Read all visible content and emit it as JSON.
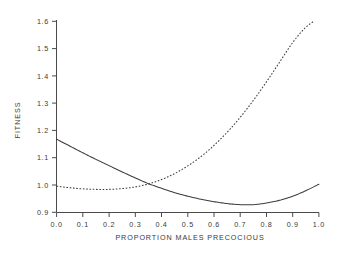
{
  "chart_data": {
    "type": "line",
    "title": "",
    "xlabel": "PROPORTION  MALES  PRECOCIOUS",
    "ylabel": "FITNESS",
    "xlim": [
      0.0,
      1.0
    ],
    "ylim": [
      0.9,
      1.6
    ],
    "grid": false,
    "legend": "none",
    "xticks": [
      "0.0",
      "0.1",
      "0.2",
      "0.3",
      "0.4",
      "0.5",
      "0.6",
      "0.7",
      "0.8",
      "0.9",
      "1.0"
    ],
    "xtick_values": [
      0.0,
      0.1,
      0.2,
      0.3,
      0.4,
      0.5,
      0.6,
      0.7,
      0.8,
      0.9,
      1.0
    ],
    "yticks": [
      "0.9",
      "1.0",
      "1.1",
      "1.2",
      "1.3",
      "1.4",
      "1.5",
      "1.6"
    ],
    "ytick_values": [
      0.9,
      1.0,
      1.1,
      1.2,
      1.3,
      1.4,
      1.5,
      1.6
    ],
    "x": [
      0.0,
      0.05,
      0.1,
      0.15,
      0.2,
      0.25,
      0.3,
      0.35,
      0.4,
      0.45,
      0.5,
      0.55,
      0.6,
      0.65,
      0.7,
      0.75,
      0.8,
      0.85,
      0.9,
      0.95,
      1.0
    ],
    "series": [
      {
        "name": "solid-curve",
        "style": "solid",
        "color": "#3c3c3c",
        "values": [
          1.168,
          1.143,
          1.118,
          1.094,
          1.071,
          1.048,
          1.026,
          1.005,
          0.988,
          0.972,
          0.959,
          0.948,
          0.939,
          0.932,
          0.928,
          0.928,
          0.934,
          0.944,
          0.959,
          0.979,
          1.003
        ]
      },
      {
        "name": "dashed-curve",
        "style": "dashed",
        "color": "#3c3c3c",
        "values": [
          0.996,
          0.99,
          0.986,
          0.984,
          0.984,
          0.987,
          0.993,
          1.004,
          1.02,
          1.042,
          1.07,
          1.104,
          1.145,
          1.193,
          1.248,
          1.31,
          1.378,
          1.45,
          1.522,
          1.578,
          1.612
        ]
      }
    ],
    "annotations": [
      {
        "name": "crossing-point",
        "x": 0.32,
        "y": 1.0
      }
    ]
  },
  "axes": {
    "x_title": "PROPORTION  MALES  PRECOCIOUS",
    "y_title": "FITNESS"
  }
}
